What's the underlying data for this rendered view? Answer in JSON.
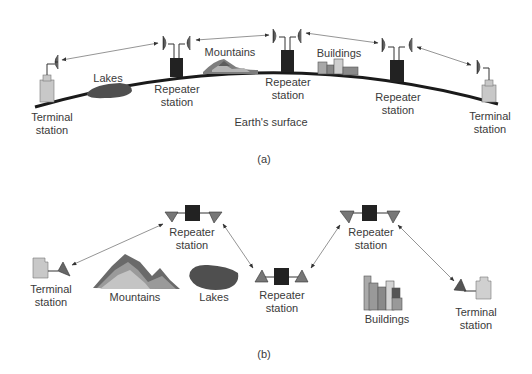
{
  "colors": {
    "ink": "#2a2a2a",
    "earth_line": "#1a1a1a",
    "repeater_box": "#222222",
    "terminal_fill": "#c8c8c8",
    "lake_fill": "#555555",
    "link_line": "#7a7a7a",
    "text": "#3a3a3a"
  },
  "diagram_a": {
    "caption": "(a)",
    "earth_label": "Earth's surface",
    "labels": {
      "terminal_left": "Terminal\nstation",
      "repeater_1": "Repeater\nstation",
      "repeater_2": "Repeater\nstation",
      "repeater_3": "Repeater\nstation",
      "terminal_right": "Terminal\nstation",
      "lakes": "Lakes",
      "mountains": "Mountains",
      "buildings": "Buildings"
    }
  },
  "diagram_b": {
    "caption": "(b)",
    "labels": {
      "terminal_left": "Terminal\nstation",
      "repeater_1": "Repeater\nstation",
      "repeater_2": "Repeater\nstation",
      "repeater_3": "Repeater\nstation",
      "terminal_right": "Terminal\nstation",
      "mountains": "Mountains",
      "lakes": "Lakes",
      "buildings": "Buildings"
    }
  }
}
